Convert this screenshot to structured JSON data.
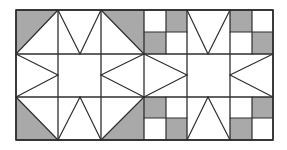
{
  "diagram": {
    "title": "Quilt block pattern: two star blocks with four-patch corners",
    "colors": {
      "background": "#ffffff",
      "shade": "#a9a9a9",
      "line": "#2e2e2e"
    },
    "grid": {
      "left": 16,
      "top": 10,
      "cell": 43,
      "cols": 6,
      "rows": 3,
      "col_x": [
        16,
        58,
        101,
        144,
        187,
        230,
        273
      ],
      "row_y": [
        10,
        54,
        97,
        140
      ]
    },
    "blocks": [
      {
        "name": "star-block-left",
        "cols": [
          0,
          1,
          2
        ],
        "corners": "half-square-triangles",
        "center": "plain-square"
      },
      {
        "name": "star-block-right",
        "cols": [
          3,
          4,
          5
        ],
        "corners": "four-patch",
        "center": "plain-square"
      }
    ],
    "shaded_polygons": [
      [
        [
          16,
          10
        ],
        [
          58,
          10
        ],
        [
          16,
          54
        ]
      ],
      [
        [
          101,
          10
        ],
        [
          144,
          10
        ],
        [
          144,
          54
        ]
      ],
      [
        [
          16,
          97
        ],
        [
          16,
          140
        ],
        [
          58,
          140
        ]
      ],
      [
        [
          144,
          97
        ],
        [
          144,
          140
        ],
        [
          101,
          140
        ]
      ],
      [
        [
          166,
          10
        ],
        [
          187,
          10
        ],
        [
          187,
          32
        ],
        [
          166,
          32
        ]
      ],
      [
        [
          144,
          32
        ],
        [
          166,
          32
        ],
        [
          166,
          54
        ],
        [
          144,
          54
        ]
      ],
      [
        [
          230,
          10
        ],
        [
          252,
          10
        ],
        [
          252,
          32
        ],
        [
          230,
          32
        ]
      ],
      [
        [
          252,
          32
        ],
        [
          273,
          32
        ],
        [
          273,
          54
        ],
        [
          252,
          54
        ]
      ],
      [
        [
          144,
          97
        ],
        [
          166,
          97
        ],
        [
          166,
          118
        ],
        [
          144,
          118
        ]
      ],
      [
        [
          166,
          118
        ],
        [
          187,
          118
        ],
        [
          187,
          140
        ],
        [
          166,
          140
        ]
      ],
      [
        [
          252,
          97
        ],
        [
          273,
          97
        ],
        [
          273,
          118
        ],
        [
          252,
          118
        ]
      ],
      [
        [
          230,
          118
        ],
        [
          252,
          118
        ],
        [
          252,
          140
        ],
        [
          230,
          140
        ]
      ]
    ],
    "lines": [
      [
        16,
        54,
        58,
        10
      ],
      [
        58,
        10,
        80,
        54
      ],
      [
        80,
        54,
        101,
        10
      ],
      [
        101,
        10,
        144,
        54
      ],
      [
        16,
        54,
        58,
        75
      ],
      [
        16,
        97,
        58,
        75
      ],
      [
        144,
        54,
        101,
        75
      ],
      [
        144,
        97,
        101,
        75
      ],
      [
        16,
        97,
        58,
        140
      ],
      [
        58,
        140,
        80,
        97
      ],
      [
        80,
        97,
        101,
        140
      ],
      [
        101,
        140,
        144,
        97
      ],
      [
        144,
        32,
        187,
        32
      ],
      [
        166,
        10,
        166,
        54
      ],
      [
        230,
        32,
        273,
        32
      ],
      [
        252,
        10,
        252,
        54
      ],
      [
        187,
        10,
        208,
        54
      ],
      [
        208,
        54,
        230,
        10
      ],
      [
        144,
        54,
        187,
        75
      ],
      [
        144,
        97,
        187,
        75
      ],
      [
        273,
        54,
        230,
        75
      ],
      [
        273,
        97,
        230,
        75
      ],
      [
        187,
        140,
        208,
        97
      ],
      [
        208,
        97,
        230,
        140
      ],
      [
        144,
        118,
        187,
        118
      ],
      [
        166,
        97,
        166,
        140
      ],
      [
        230,
        118,
        273,
        118
      ],
      [
        252,
        97,
        252,
        140
      ]
    ]
  }
}
